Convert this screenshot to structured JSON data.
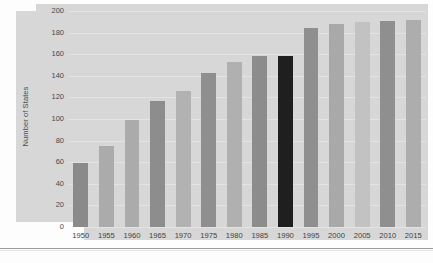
{
  "chart_data": {
    "type": "bar",
    "title": "",
    "subtitle": "",
    "xlabel": "",
    "ylabel": "Number of States",
    "categories": [
      "1950",
      "1955",
      "1960",
      "1965",
      "1970",
      "1975",
      "1980",
      "1985",
      "1990",
      "1995",
      "2000",
      "2005",
      "2010",
      "2015"
    ],
    "values": [
      59,
      75,
      99,
      117,
      126,
      143,
      153,
      158,
      158,
      184,
      188,
      190,
      191,
      192
    ],
    "ylim": [
      0,
      200
    ],
    "ytick_values": [
      200,
      180,
      160,
      140,
      120,
      100,
      80,
      60,
      40,
      20,
      0
    ],
    "ytick_labels": [
      "200",
      "180",
      "160",
      "140",
      "120",
      "100",
      "80",
      "60",
      "40",
      "20",
      "0"
    ],
    "grid": true,
    "grid_axis": "y",
    "legend": false,
    "legend_position": "none",
    "bar_colors": [
      "#8a8a8a",
      "#ababab",
      "#ababab",
      "#8d8d8d",
      "#b2b2b2",
      "#8f8f8f",
      "#b0b0b0",
      "#8c8c8c",
      "#1f1f1f",
      "#8f8f8f",
      "#a9a9a9",
      "#c2c2c2",
      "#8f8f8f",
      "#adadad"
    ],
    "highlighted_category": "1990",
    "highlight_color": "#1f1f1f",
    "plot_background": "#d7d7d7",
    "page_background": "#fdfdfd"
  }
}
